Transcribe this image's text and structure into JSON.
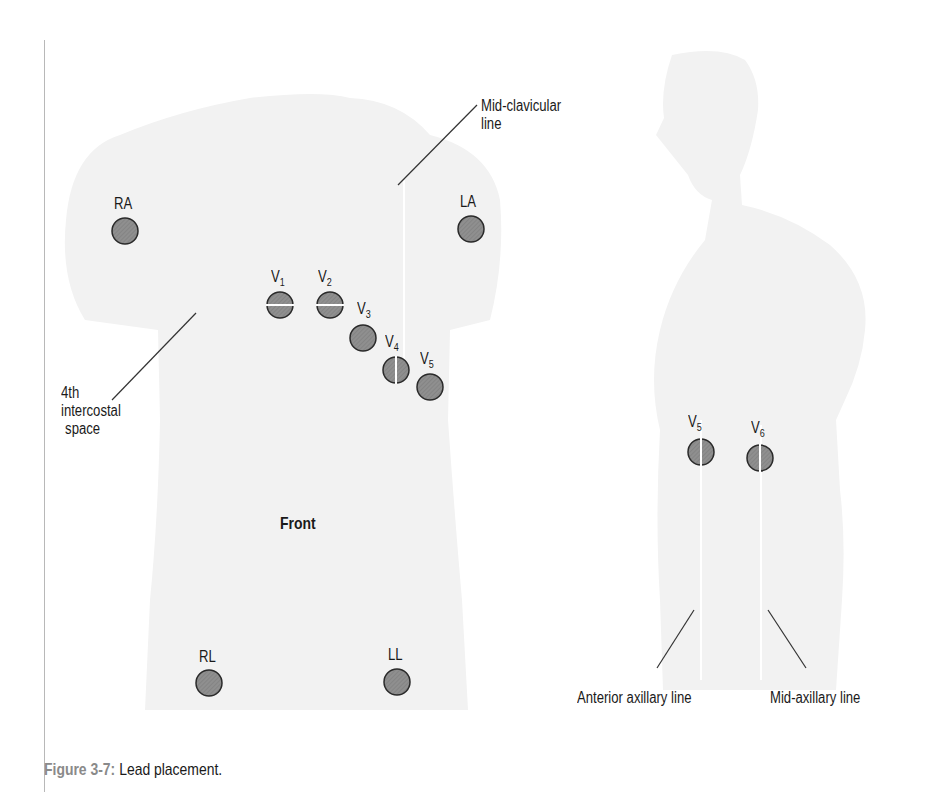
{
  "figure": {
    "caption_label": "Figure 3-7:",
    "caption_text": " Lead placement."
  },
  "front_view": {
    "title": "Front",
    "annotations": {
      "mid_clavicular": [
        "Mid-clavicular",
        "line"
      ],
      "intercostal": [
        "4th",
        "intercostal",
        "space"
      ]
    },
    "limb_leads": [
      {
        "label": "RA"
      },
      {
        "label": "LA"
      },
      {
        "label": "RL"
      },
      {
        "label": "LL"
      }
    ],
    "chest_leads": [
      {
        "label": "V",
        "sub": "1"
      },
      {
        "label": "V",
        "sub": "2"
      },
      {
        "label": "V",
        "sub": "3"
      },
      {
        "label": "V",
        "sub": "4"
      },
      {
        "label": "V",
        "sub": "5"
      }
    ]
  },
  "side_view": {
    "chest_leads": [
      {
        "label": "V",
        "sub": "5"
      },
      {
        "label": "V",
        "sub": "6"
      }
    ],
    "annotations": {
      "anterior_axillary": "Anterior axillary line",
      "mid_axillary": "Mid-axillary line"
    }
  },
  "colors": {
    "body_fill": "#f2f2f2",
    "electrode_fill": "#8c8c8c",
    "electrode_stroke": "#2a2a2a",
    "caption_accent": "#8a8a8a"
  }
}
